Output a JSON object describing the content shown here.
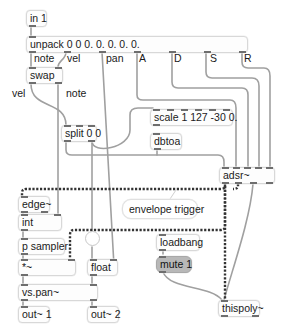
{
  "patch": {
    "objects": {
      "in1": "in 1",
      "unpack": "unpack 0 0 0. 0. 0. 0. 0.",
      "swap": "swap",
      "split": "split 0 0",
      "scale": "scale 1 127 -30 0.",
      "dbtoa": "dbtoa",
      "adsr": "adsr~",
      "edge": "edge~",
      "int": "int",
      "psampler": "p sampler",
      "times": "*~",
      "float": "float",
      "vspan": "vs.pan~",
      "out1": "out~ 1",
      "out2": "out~ 2",
      "loadbang": "loadbang",
      "mute": "mute 1",
      "thispoly": "thispoly~"
    },
    "labels": {
      "unpack_note": "note",
      "unpack_vel": "vel",
      "unpack_pan": "pan",
      "unpack_A": "A",
      "unpack_D": "D",
      "unpack_S": "S",
      "unpack_R": "R",
      "swap_vel": "vel",
      "swap_note": "note"
    },
    "comment": "envelope trigger"
  },
  "colors": {
    "cord": "#9a9a9a",
    "signal_cord": "#3a3a3a",
    "message_box": "#b8b8b8"
  }
}
